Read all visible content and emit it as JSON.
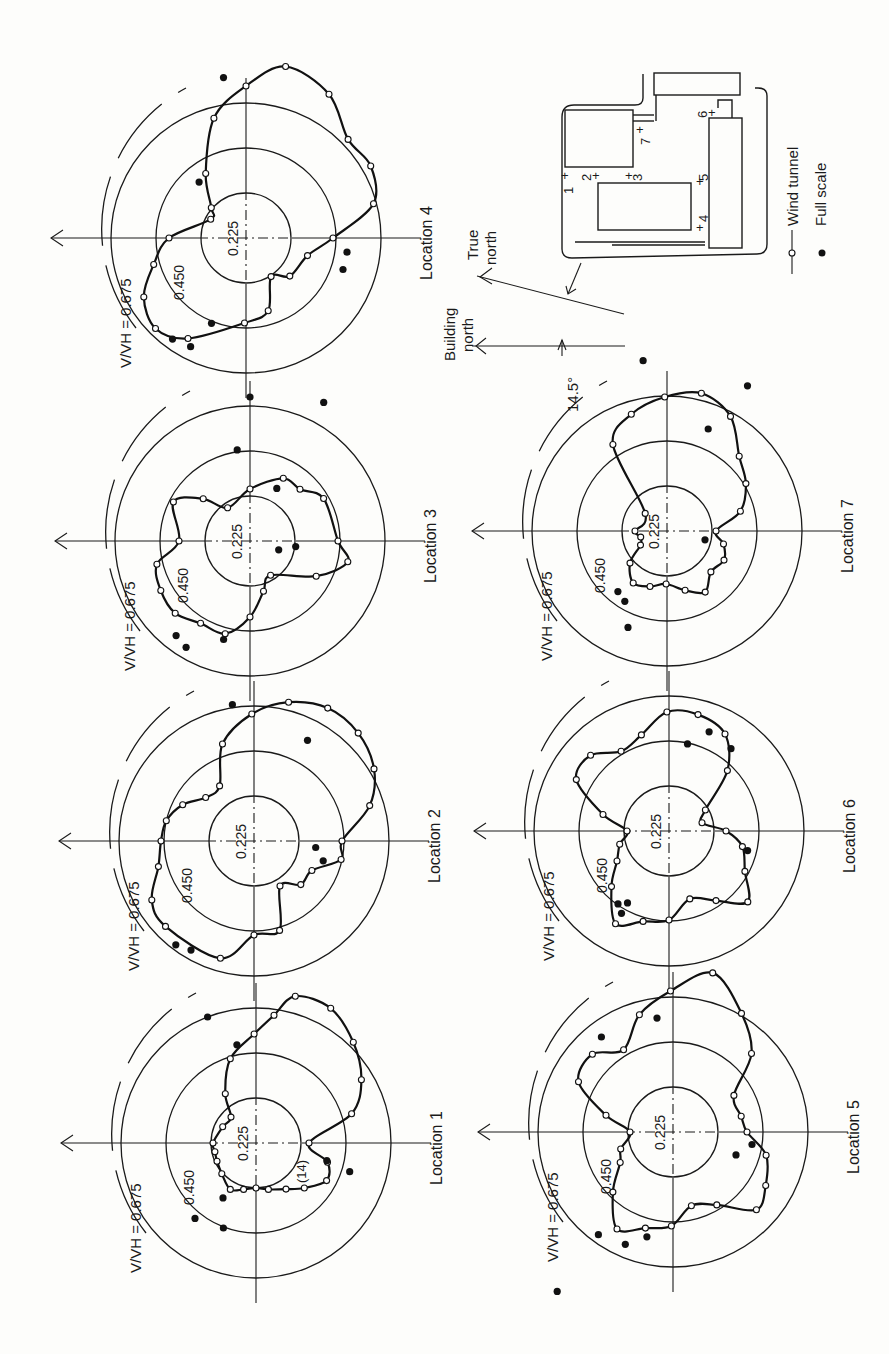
{
  "figure": {
    "orientation": "rotated 90 degrees counter-clockwise (page-up points to image-left)",
    "ring_values": [
      0.225,
      0.45,
      0.675
    ],
    "ring_labels": [
      "0.225",
      "0.450",
      "0.675"
    ],
    "ratio_label": {
      "numerator": "V",
      "denominator": "V",
      "subscript": "H",
      "equals": "= 0.675"
    },
    "building_north_label": [
      "Building",
      "north"
    ],
    "true_north_label": [
      "True",
      "north"
    ],
    "angle_label": "14.5°",
    "plan_locations": [
      "1",
      "2",
      "3",
      "4",
      "5",
      "6",
      "7"
    ],
    "legend": {
      "wind_tunnel": "Wind tunnel",
      "full_scale": "Full scale"
    },
    "annotation_loc1": "(14)"
  },
  "chart_data": [
    {
      "type": "polar-line",
      "title": "Location 4",
      "label": "Location 4",
      "center_px": [
        246,
        238
      ],
      "rlabel": "V/V_H",
      "rticks": [
        0.225,
        0.45,
        0.675
      ],
      "angle_reference": "degrees clockwise from building north",
      "wind_tunnel": [
        [
          0,
          0.385
        ],
        [
          28,
          0.2
        ],
        [
          41,
          0.23
        ],
        [
          58,
          0.38
        ],
        [
          75,
          0.62
        ],
        [
          90,
          0.76
        ],
        [
          103,
          0.88
        ],
        [
          120,
          0.83
        ],
        [
          136,
          0.71
        ],
        [
          150,
          0.72
        ],
        [
          165,
          0.66
        ],
        [
          180,
          0.435
        ],
        [
          196,
          0.32
        ],
        [
          221,
          0.29
        ],
        [
          237,
          0.23
        ],
        [
          253,
          0.38
        ],
        [
          271,
          0.425
        ],
        [
          300,
          0.58
        ],
        [
          315,
          0.64
        ],
        [
          330,
          0.59
        ],
        [
          344,
          0.48
        ]
      ],
      "full_scale": [
        [
          82,
          0.81
        ],
        [
          50,
          0.365
        ],
        [
          188,
          0.51
        ],
        [
          198,
          0.51
        ],
        [
          292,
          0.46
        ],
        [
          297,
          0.61
        ],
        [
          306,
          0.625
        ]
      ]
    },
    {
      "type": "polar-line",
      "title": "Location 3",
      "label": "Location 3",
      "center_px": [
        250,
        541
      ],
      "rlabel": "V/V_H",
      "rticks": [
        0.225,
        0.45,
        0.675
      ],
      "angle_reference": "degrees clockwise from building north",
      "wind_tunnel": [
        [
          0,
          0.355
        ],
        [
          27,
          0.43
        ],
        [
          42,
          0.315
        ],
        [
          56,
          0.2
        ],
        [
          90,
          0.26
        ],
        [
          118,
          0.355
        ],
        [
          134,
          0.36
        ],
        [
          150,
          0.425
        ],
        [
          180,
          0.44
        ],
        [
          192,
          0.5
        ],
        [
          208,
          0.375
        ],
        [
          239,
          0.2
        ],
        [
          255,
          0.26
        ],
        [
          270,
          0.38
        ],
        [
          285,
          0.48
        ],
        [
          301,
          0.48
        ],
        [
          316,
          0.52
        ],
        [
          331,
          0.51
        ],
        [
          346,
          0.48
        ]
      ],
      "full_scale": [
        [
          90,
          0.72
        ],
        [
          118,
          0.785
        ],
        [
          82,
          0.46
        ],
        [
          117,
          0.295
        ],
        [
          197,
          0.15
        ],
        [
          187,
          0.23
        ],
        [
          308,
          0.6
        ],
        [
          301,
          0.62
        ],
        [
          285,
          0.51
        ]
      ]
    },
    {
      "type": "polar-line",
      "title": "Location 2",
      "label": "Location 2",
      "center_px": [
        254,
        841
      ],
      "rlabel": "V/V_H",
      "rticks": [
        0.225,
        0.45,
        0.675
      ],
      "angle_reference": "degrees clockwise from building north",
      "wind_tunnel": [
        [
          0,
          0.465
        ],
        [
          13,
          0.45
        ],
        [
          27,
          0.4
        ],
        [
          42,
          0.325
        ],
        [
          58,
          0.325
        ],
        [
          72,
          0.51
        ],
        [
          89,
          0.635
        ],
        [
          104,
          0.715
        ],
        [
          119,
          0.76
        ],
        [
          134,
          0.75
        ],
        [
          149,
          0.7
        ],
        [
          163,
          0.605
        ],
        [
          180,
          0.44
        ],
        [
          192,
          0.445
        ],
        [
          207,
          0.325
        ],
        [
          223,
          0.32
        ],
        [
          240,
          0.26
        ],
        [
          254,
          0.465
        ],
        [
          270,
          0.47
        ],
        [
          286,
          0.61
        ],
        [
          316,
          0.615
        ],
        [
          330,
          0.59
        ],
        [
          345,
          0.495
        ]
      ],
      "full_scale": [
        [
          81,
          0.69
        ],
        [
          118,
          0.57
        ],
        [
          186,
          0.31
        ],
        [
          196,
          0.36
        ],
        [
          307,
          0.65
        ],
        [
          300,
          0.63
        ]
      ]
    },
    {
      "type": "polar-line",
      "title": "Location 1",
      "label": "Location 1",
      "center_px": [
        256,
        1143
      ],
      "rlabel": "V/V_H",
      "rticks": [
        0.225,
        0.45,
        0.675
      ],
      "angle_reference": "degrees clockwise from building north",
      "wind_tunnel": [
        [
          0,
          0.215
        ],
        [
          26,
          0.185
        ],
        [
          46,
          0.18
        ],
        [
          58,
          0.29
        ],
        [
          73,
          0.44
        ],
        [
          89,
          0.545
        ],
        [
          98,
          0.645
        ],
        [
          105,
          0.76
        ],
        [
          119,
          0.77
        ],
        [
          134,
          0.7
        ],
        [
          149,
          0.615
        ],
        [
          163,
          0.5
        ],
        [
          180,
          0.265
        ],
        [
          195,
          0.37
        ],
        [
          208,
          0.4
        ],
        [
          223,
          0.33
        ],
        [
          237,
          0.275
        ],
        [
          255,
          0.24
        ],
        [
          270,
          0.225
        ],
        [
          285,
          0.24
        ],
        [
          299,
          0.265
        ],
        [
          318,
          0.23
        ],
        [
          335,
          0.215
        ],
        [
          348,
          0.21
        ]
      ],
      "full_scale": [
        [
          69,
          0.675
        ],
        [
          79,
          0.5
        ],
        [
          194,
          0.365
        ],
        [
          197,
          0.49
        ],
        [
          301,
          0.32
        ],
        [
          309,
          0.485
        ],
        [
          291,
          0.455
        ]
      ],
      "annotation": "(14)"
    },
    {
      "type": "polar-line",
      "title": "Location 7",
      "label": "Location 7",
      "center_px": [
        667,
        531
      ],
      "rlabel": "V/V_H",
      "rticks": [
        0.225,
        0.45,
        0.675
      ],
      "angle_reference": "degrees clockwise from building north",
      "wind_tunnel": [
        [
          0,
          0.16
        ],
        [
          39,
          0.14
        ],
        [
          58,
          0.51
        ],
        [
          73,
          0.61
        ],
        [
          89,
          0.67
        ],
        [
          104,
          0.71
        ],
        [
          119,
          0.655
        ],
        [
          134,
          0.52
        ],
        [
          149,
          0.46
        ],
        [
          165,
          0.38
        ],
        [
          180,
          0.245
        ],
        [
          193,
          0.29
        ],
        [
          207,
          0.32
        ],
        [
          223,
          0.3
        ],
        [
          238,
          0.36
        ],
        [
          253,
          0.31
        ],
        [
          271,
          0.265
        ],
        [
          287,
          0.29
        ],
        [
          303,
          0.31
        ],
        [
          319,
          0.245
        ],
        [
          332,
          0.15
        ],
        [
          347,
          0.135
        ]
      ],
      "full_scale": [
        [
          82,
          0.86
        ],
        [
          119,
          0.83
        ],
        [
          112,
          0.55
        ],
        [
          193,
          0.195
        ],
        [
          309,
          0.39
        ],
        [
          301,
          0.41
        ],
        [
          292,
          0.52
        ]
      ]
    },
    {
      "type": "polar-line",
      "title": "Location 6",
      "label": "Location 6",
      "center_px": [
        669,
        831
      ],
      "rlabel": "V/V_H",
      "rticks": [
        0.225,
        0.45,
        0.675
      ],
      "angle_reference": "degrees clockwise from building north",
      "wind_tunnel": [
        [
          0,
          0.21
        ],
        [
          14,
          0.34
        ],
        [
          29,
          0.53
        ],
        [
          44,
          0.545
        ],
        [
          59,
          0.465
        ],
        [
          74,
          0.5
        ],
        [
          89,
          0.595
        ],
        [
          104,
          0.6
        ],
        [
          120,
          0.56
        ],
        [
          134,
          0.42
        ],
        [
          150,
          0.21
        ],
        [
          166,
          0.17
        ],
        [
          180,
          0.285
        ],
        [
          192,
          0.375
        ],
        [
          208,
          0.43
        ],
        [
          222,
          0.53
        ],
        [
          236,
          0.42
        ],
        [
          253,
          0.355
        ],
        [
          270,
          0.445
        ],
        [
          286,
          0.47
        ],
        [
          300,
          0.535
        ],
        [
          316,
          0.4
        ],
        [
          330,
          0.3
        ],
        [
          345,
          0.255
        ]
      ],
      "full_scale": [
        [
          112,
          0.535
        ],
        [
          102,
          0.445
        ],
        [
          127,
          0.515
        ],
        [
          194,
          0.405
        ],
        [
          305,
          0.445
        ],
        [
          300,
          0.415
        ],
        [
          300,
          0.475
        ]
      ]
    },
    {
      "type": "polar-line",
      "title": "Location 5",
      "label": "Location 5",
      "center_px": [
        673,
        1132
      ],
      "rlabel": "V/V_H",
      "rticks": [
        0.225,
        0.45,
        0.675
      ],
      "angle_reference": "degrees clockwise from building north",
      "wind_tunnel": [
        [
          0,
          0.215
        ],
        [
          14,
          0.345
        ],
        [
          28,
          0.535
        ],
        [
          44,
          0.56
        ],
        [
          59,
          0.48
        ],
        [
          74,
          0.61
        ],
        [
          89,
          0.705
        ],
        [
          104,
          0.82
        ],
        [
          120,
          0.685
        ],
        [
          135,
          0.555
        ],
        [
          149,
          0.355
        ],
        [
          167,
          0.35
        ],
        [
          180,
          0.37
        ],
        [
          194,
          0.48
        ],
        [
          210,
          0.535
        ],
        [
          223,
          0.57
        ],
        [
          239,
          0.425
        ],
        [
          256,
          0.38
        ],
        [
          271,
          0.47
        ],
        [
          286,
          0.5
        ],
        [
          300,
          0.56
        ],
        [
          315,
          0.425
        ],
        [
          330,
          0.305
        ],
        [
          342,
          0.275
        ]
      ],
      "full_scale": [
        [
          82,
          0.575
        ],
        [
          53,
          0.595
        ],
        [
          200,
          0.335
        ],
        [
          189,
          0.4
        ],
        [
          306,
          0.635
        ],
        [
          293,
          0.61
        ],
        [
          284,
          0.54
        ],
        [
          306,
          0.985
        ]
      ]
    }
  ]
}
